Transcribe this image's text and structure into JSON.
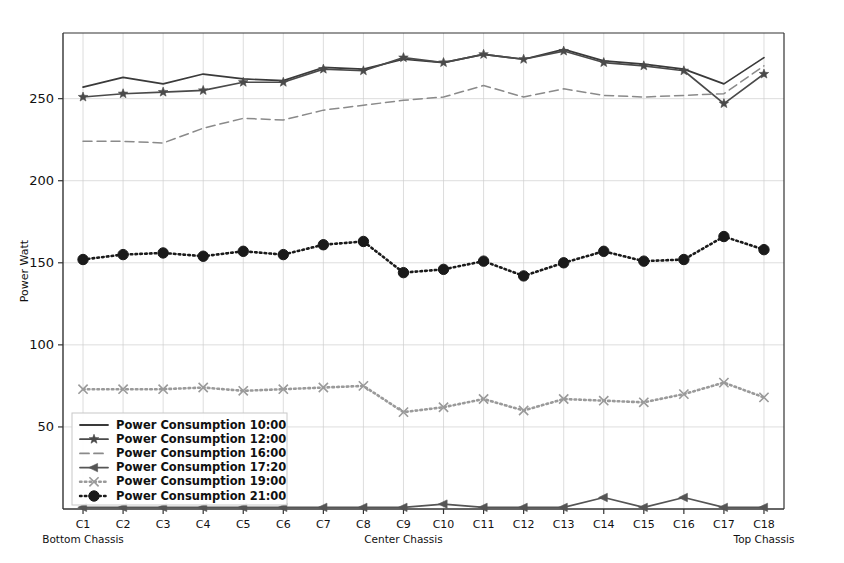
{
  "chart_data": {
    "type": "line",
    "title": "",
    "xlabel": "",
    "ylabel": "Power Watt",
    "ylim": [
      0,
      290
    ],
    "yticks": [
      50,
      100,
      150,
      200,
      250
    ],
    "grid": true,
    "legend_position": "lower left",
    "categories": [
      "C1",
      "C2",
      "C3",
      "C4",
      "C5",
      "C6",
      "C7",
      "C8",
      "C9",
      "C10",
      "C11",
      "C12",
      "C13",
      "C14",
      "C15",
      "C16",
      "C17",
      "C18"
    ],
    "x_group_labels": [
      {
        "text": "Bottom Chassis",
        "at": "C1"
      },
      {
        "text": "Center Chassis",
        "at": "C9"
      },
      {
        "text": "Top Chassis",
        "at": "C18"
      }
    ],
    "series": [
      {
        "name": "Power Consumption 10:00",
        "color": "#3a3a3a",
        "style": "solid",
        "marker": "none",
        "values": [
          257,
          263,
          259,
          265,
          262,
          261,
          269,
          268,
          274,
          272,
          277,
          274,
          280,
          273,
          271,
          268,
          259,
          275
        ]
      },
      {
        "name": "Power Consumption 12:00",
        "color": "#4a4a4a",
        "style": "solid",
        "marker": "star",
        "values": [
          251,
          253,
          254,
          255,
          260,
          260,
          268,
          267,
          275,
          272,
          277,
          274,
          279,
          272,
          270,
          267,
          247,
          265
        ]
      },
      {
        "name": "Power Consumption 16:00",
        "color": "#8a8a8a",
        "style": "dashed",
        "marker": "none",
        "values": [
          224,
          224,
          223,
          232,
          238,
          237,
          243,
          246,
          249,
          251,
          258,
          251,
          256,
          252,
          251,
          252,
          253,
          270
        ]
      },
      {
        "name": "Power Consumption 17:20",
        "color": "#555555",
        "style": "solid",
        "marker": "left-triangle",
        "values": [
          1,
          1,
          1,
          1,
          1,
          1,
          1,
          1,
          1,
          3,
          1,
          1,
          1,
          7,
          1,
          7,
          1,
          1
        ]
      },
      {
        "name": "Power Consumption 19:00",
        "color": "#9a9a9a",
        "style": "dotted",
        "marker": "x",
        "values": [
          73,
          73,
          73,
          74,
          72,
          73,
          74,
          75,
          59,
          62,
          67,
          60,
          67,
          66,
          65,
          70,
          77,
          68
        ]
      },
      {
        "name": "Power Consumption 21:00",
        "color": "#1a1a1a",
        "style": "dotted",
        "marker": "circle",
        "values": [
          152,
          155,
          156,
          154,
          157,
          155,
          161,
          163,
          144,
          146,
          151,
          142,
          150,
          157,
          151,
          152,
          166,
          158
        ]
      }
    ]
  }
}
